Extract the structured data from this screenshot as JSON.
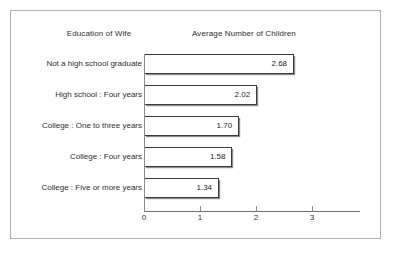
{
  "figure": {
    "border_color": "#b0b0b0",
    "background": "#ffffff"
  },
  "headers": {
    "category_column": "Education of Wife",
    "value_column": "Average Number of Children"
  },
  "axis": {
    "tick_labels": [
      "0",
      "1",
      "2",
      "3"
    ],
    "tick_values": [
      0,
      1,
      2,
      3
    ]
  },
  "chart_data": {
    "type": "bar",
    "orientation": "horizontal",
    "title": "",
    "subtitle": "",
    "xlabel": "Average Number of Children",
    "ylabel": "Education of Wife",
    "categories": [
      "Not a high school graduate",
      "High school : Four years",
      "College : One to three years",
      "College : Four years",
      "College : Five or more years"
    ],
    "values": [
      2.68,
      2.02,
      1.7,
      1.58,
      1.34
    ],
    "value_labels": [
      "2.68",
      "2.02",
      "1.70",
      "1.58",
      "1.34"
    ],
    "xlim": [
      0,
      3.86
    ],
    "xticks": [
      0,
      1,
      2,
      3
    ],
    "xticklabels": [
      "0",
      "1",
      "2",
      "3"
    ],
    "grid": false,
    "legend": false,
    "bar_fill": "#ffffff",
    "bar_edge_color": "#3a3a3a",
    "value_label_position": "inside-end"
  },
  "rows": [
    {
      "label": "Not a high school graduate",
      "value": 2.68,
      "value_label": "2.68"
    },
    {
      "label": "High school : Four years",
      "value": 2.02,
      "value_label": "2.02"
    },
    {
      "label": "College : One to three years",
      "value": 1.7,
      "value_label": "1.70"
    },
    {
      "label": "College : Four years",
      "value": 1.58,
      "value_label": "1.58"
    },
    {
      "label": "College : Five or more years",
      "value": 1.34,
      "value_label": "1.34"
    }
  ]
}
